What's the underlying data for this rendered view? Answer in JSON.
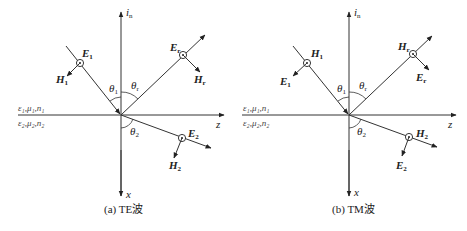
{
  "figure_a": {
    "caption": "(a) TE波",
    "axis_normal": "i",
    "axis_normal_sub": "n",
    "axis_z": "z",
    "axis_x": "x",
    "medium1": "ε₁,μ₁,n₁",
    "medium2": "ε₂,μ₂,n₂",
    "theta_i": "θ",
    "theta_i_sub": "1",
    "theta_r": "θ",
    "theta_r_sub": "r",
    "theta_t": "θ",
    "theta_t_sub": "2",
    "incident_dot_label": "E",
    "incident_dot_sub": "1",
    "incident_arrow_label": "H",
    "incident_arrow_sub": "1",
    "reflected_dot_label": "E",
    "reflected_dot_sub": "r",
    "reflected_arrow_label": "H",
    "reflected_arrow_sub": "r",
    "transmitted_dot_label": "E",
    "transmitted_dot_sub": "2",
    "transmitted_arrow_label": "H",
    "transmitted_arrow_sub": "2"
  },
  "figure_b": {
    "caption": "(b) TM波",
    "axis_normal": "i",
    "axis_normal_sub": "n",
    "axis_z": "z",
    "axis_x": "x",
    "medium1": "ε₁,μ₁,n₁",
    "medium2": "ε₂,μ₂,n₂",
    "theta_i": "θ",
    "theta_i_sub": "1",
    "theta_r": "θ",
    "theta_r_sub": "r",
    "theta_t": "θ",
    "theta_t_sub": "2",
    "incident_dot_label": "H",
    "incident_dot_sub": "1",
    "incident_arrow_label": "E",
    "incident_arrow_sub": "1",
    "reflected_dot_label": "H",
    "reflected_dot_sub": "r",
    "reflected_arrow_label": "E",
    "reflected_arrow_sub": "r",
    "transmitted_dot_label": "H",
    "transmitted_dot_sub": "2",
    "transmitted_arrow_label": "E",
    "transmitted_arrow_sub": "2"
  },
  "colors": {
    "line": "#333333",
    "background": "#ffffff"
  }
}
